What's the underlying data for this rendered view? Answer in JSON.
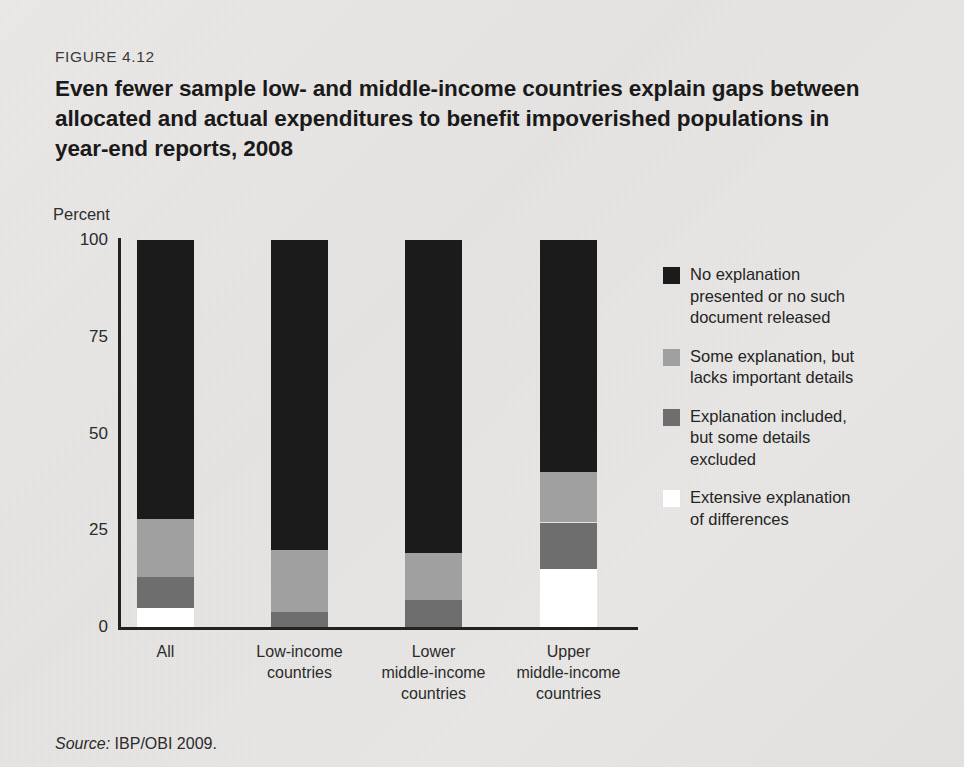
{
  "figure": {
    "number": "FIGURE 4.12",
    "title": "Even fewer sample low- and middle-income countries explain gaps between allocated and actual expenditures to benefit impoverished populations in year-end reports, 2008",
    "source_word": "Source:",
    "source_text": "IBP/OBI 2009."
  },
  "chart_data": {
    "type": "bar",
    "subtype": "stacked-vertical-100",
    "title": "Even fewer sample low- and middle-income countries explain gaps between allocated and actual expenditures to benefit impoverished populations in year-end reports, 2008",
    "xlabel": "",
    "ylabel": "Percent",
    "ylim": [
      0,
      100
    ],
    "yticks": [
      "0",
      "25",
      "50",
      "75",
      "100"
    ],
    "ytick_values": [
      0,
      25,
      50,
      75,
      100
    ],
    "grid": false,
    "legend_position": "right",
    "categories": [
      "All",
      "Low-income countries",
      "Lower middle-income countries",
      "Upper middle-income countries"
    ],
    "category_lines": [
      [
        "All"
      ],
      [
        "Low-income",
        "countries"
      ],
      [
        "Lower",
        "middle-income",
        "countries"
      ],
      [
        "Upper",
        "middle-income",
        "countries"
      ]
    ],
    "series": [
      {
        "name": "Extensive explanation of differences",
        "color": "#ffffff",
        "values": [
          5,
          0,
          0,
          15
        ]
      },
      {
        "name": "Explanation included, but some details excluded",
        "color": "#6e6e6e",
        "values": [
          8,
          4,
          7,
          12
        ]
      },
      {
        "name": "Some explanation, but lacks important details",
        "color": "#a0a0a0",
        "values": [
          15,
          16,
          12,
          13
        ]
      },
      {
        "name": "No explanation presented or no such document released",
        "color": "#1b1b1b",
        "values": [
          72,
          80,
          81,
          60
        ]
      }
    ],
    "stack_order_bottom_to_top": [
      "Extensive explanation of differences",
      "Explanation included, but some details excluded",
      "Some explanation, but lacks important details",
      "No explanation presented or no such document released"
    ]
  },
  "legend": {
    "items": [
      {
        "color": "#1b1b1b",
        "lines": [
          "No explanation",
          "presented or no such",
          "document released"
        ]
      },
      {
        "color": "#a0a0a0",
        "lines": [
          "Some explanation, but",
          "lacks important details"
        ]
      },
      {
        "color": "#6e6e6e",
        "lines": [
          "Explanation included,",
          "but some details",
          "excluded"
        ]
      },
      {
        "color": "#ffffff",
        "lines": [
          "Extensive explanation",
          "of differences"
        ]
      }
    ]
  },
  "colors": {
    "background": "#e8e7e5",
    "axis": "#222222",
    "text": "#231f20"
  }
}
